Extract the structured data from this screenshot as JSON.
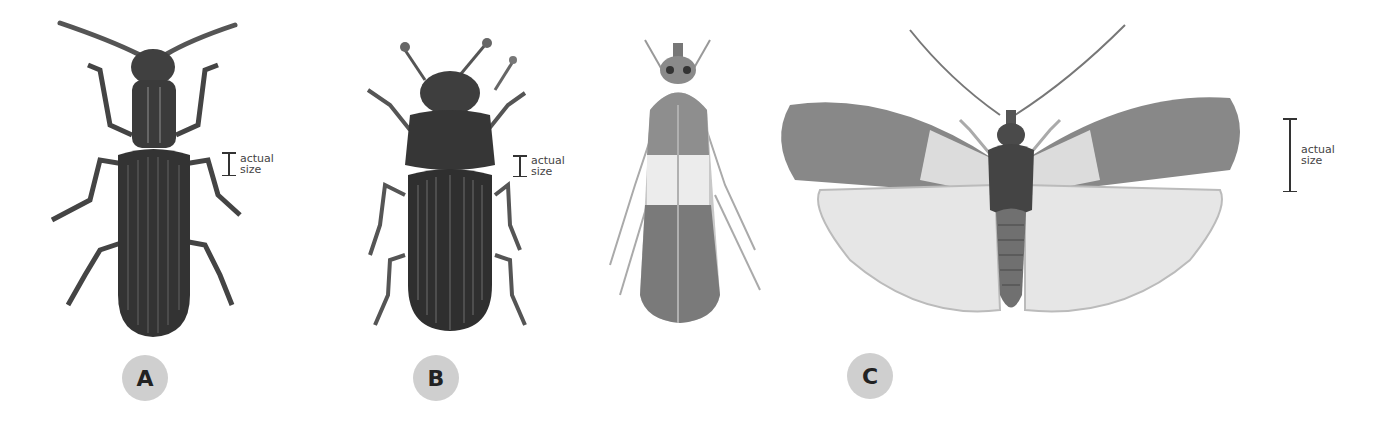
{
  "figure": {
    "specimens": [
      {
        "id": "A",
        "label": "A",
        "kind": "beetle",
        "description": "sawtoothed grain beetle",
        "scale_label_line1": "actual",
        "scale_label_line2": "size"
      },
      {
        "id": "B",
        "label": "B",
        "kind": "beetle",
        "description": "flour beetle",
        "scale_label_line1": "actual",
        "scale_label_line2": "size"
      },
      {
        "id": "C",
        "label": "C",
        "kind": "moth",
        "description": "Indian meal moth (at rest and wings spread)",
        "scale_label_line1": "actual",
        "scale_label_line2": "size"
      }
    ],
    "colors": {
      "background": "#ffffff",
      "badge_fill": "#cfcfcf",
      "badge_text": "#222222",
      "scale_bar": "#333333",
      "insect_dark": "#3a3a3a"
    }
  }
}
